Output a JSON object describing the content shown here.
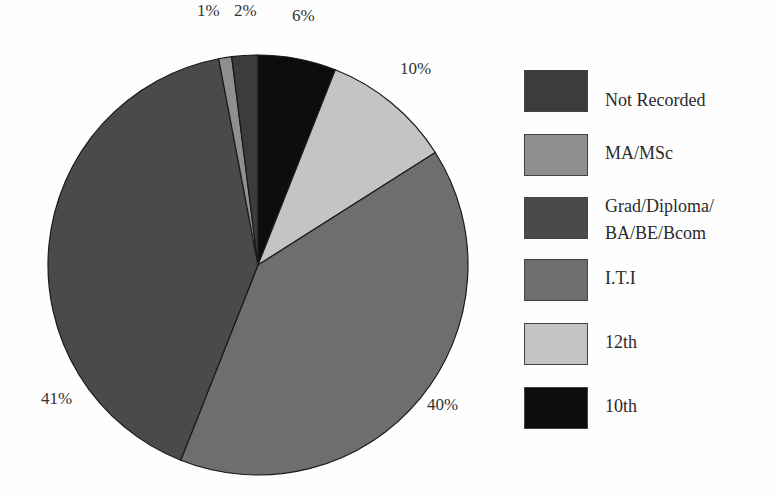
{
  "chart_data": {
    "type": "pie",
    "title": "",
    "categories": [
      "10th",
      "12th",
      "I.T.I",
      "Grad/Diploma/BA/BE/Bcom",
      "MA/MSc",
      "Not Recorded"
    ],
    "values": [
      6,
      10,
      40,
      41,
      1,
      2
    ],
    "unit": "%",
    "start_angle": "12 o'clock, clockwise",
    "colors": [
      "#0d0d0d",
      "#c4c4c4",
      "#6e6e6e",
      "#4a4a4a",
      "#8f8f8f",
      "#3c3c3c"
    ],
    "legend_position": "right",
    "legend_order": [
      "Not Recorded",
      "MA/MSc",
      "Grad/Diploma/BA/BE/Bcom",
      "I.T.I",
      "12th",
      "10th"
    ]
  },
  "slice_labels": {
    "s10th": "6%",
    "s12th": "10%",
    "iti": "40%",
    "grad": "41%",
    "ma": "1%",
    "nr": "2%"
  },
  "legend": {
    "items": [
      {
        "label": "Not Recorded",
        "color": "#3c3c3c"
      },
      {
        "label": "MA/MSc",
        "color": "#8f8f8f"
      },
      {
        "label": "Grad/Diploma/\nBA/BE/Bcom",
        "color": "#4a4a4a"
      },
      {
        "label": "I.T.I",
        "color": "#6e6e6e"
      },
      {
        "label": "12th",
        "color": "#c4c4c4"
      },
      {
        "label": "10th",
        "color": "#0d0d0d"
      }
    ]
  }
}
